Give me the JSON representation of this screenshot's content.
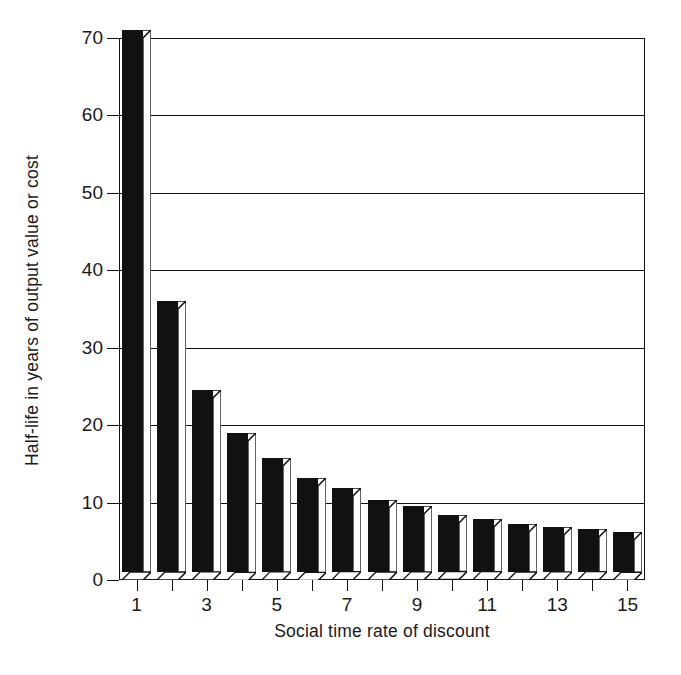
{
  "chart_data": {
    "type": "bar",
    "title": "",
    "subtitle": "",
    "xlabel": "Social time rate of discount",
    "ylabel": "Half-life in years of output value or cost",
    "categories": [
      1,
      2,
      3,
      4,
      5,
      6,
      7,
      8,
      9,
      10,
      11,
      12,
      13,
      14,
      15
    ],
    "values": [
      70,
      35,
      23.5,
      18,
      14.7,
      12.2,
      10.8,
      9.3,
      8.5,
      7.3,
      6.8,
      6.2,
      5.8,
      5.5,
      5.2
    ],
    "series": [
      {
        "name": "Half-life",
        "values": [
          70,
          35,
          23.5,
          18,
          14.7,
          12.2,
          10.8,
          9.3,
          8.5,
          7.3,
          6.8,
          6.2,
          5.8,
          5.5,
          5.2
        ]
      }
    ],
    "ylim": [
      0,
      70
    ],
    "xlim": [
      0.5,
      15.5
    ],
    "ytick_labels": [
      "0",
      "10",
      "20",
      "30",
      "40",
      "50",
      "60",
      "70"
    ],
    "ytick_values": [
      0,
      10,
      20,
      30,
      40,
      50,
      60,
      70
    ],
    "xtick_labels": [
      "1",
      "3",
      "5",
      "7",
      "9",
      "11",
      "13",
      "15"
    ],
    "xtick_values": [
      1,
      3,
      5,
      7,
      9,
      11,
      13,
      15
    ],
    "xtick_minor_values": [
      2,
      4,
      6,
      8,
      10,
      12,
      14
    ],
    "grid": "horizontal",
    "legend": "none",
    "bar_style": "3d-block",
    "bar_fill_color": "#111111",
    "bar_face_color": "#FFFFFF",
    "bar_edge_color": "#111111",
    "background_color": "#FFFFFF",
    "annotations": []
  }
}
